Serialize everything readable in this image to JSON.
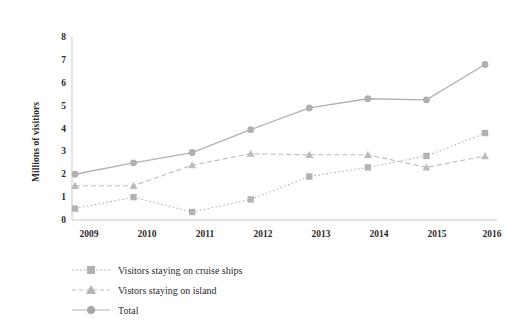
{
  "chart_data": {
    "type": "line",
    "title": "",
    "xlabel": "",
    "ylabel": "Millions of visitiors",
    "categories": [
      "2009",
      "2010",
      "2011",
      "2012",
      "2013",
      "2014",
      "2015",
      "2016"
    ],
    "ylim": [
      0,
      8
    ],
    "yticks": [
      "0",
      "1",
      "2",
      "3",
      "4",
      "5",
      "6",
      "7",
      "8"
    ],
    "grid": false,
    "legend_position": "bottom-left",
    "series": [
      {
        "name": "Visitors staying on cruise ships",
        "marker": "square",
        "line_style": "dotted",
        "color": "#b3b3b3",
        "values": [
          0.5,
          1.0,
          0.35,
          0.9,
          1.9,
          2.3,
          2.8,
          3.8
        ]
      },
      {
        "name": "Vistors staying on island",
        "marker": "triangle",
        "line_style": "dashed",
        "color": "#bcbcbc",
        "values": [
          1.5,
          1.5,
          2.4,
          2.9,
          2.85,
          2.85,
          2.3,
          2.8
        ]
      },
      {
        "name": "Total",
        "marker": "circle",
        "line_style": "solid",
        "color": "#b0b0b0",
        "values": [
          2.0,
          2.5,
          2.95,
          3.95,
          4.9,
          5.3,
          5.25,
          6.8
        ]
      }
    ]
  },
  "axis": {
    "y_title": "Millions of visitiors",
    "y_ticks": [
      "8",
      "7",
      "6",
      "5",
      "4",
      "3",
      "2",
      "1",
      "0"
    ],
    "x_ticks": [
      "2009",
      "2010",
      "2011",
      "2012",
      "2013",
      "2014",
      "2015",
      "2016"
    ]
  },
  "legend": {
    "items": [
      {
        "label": "Visitors staying on cruise ships",
        "marker": "square-marker-icon"
      },
      {
        "label": "Vistors staying on island",
        "marker": "triangle-marker-icon"
      },
      {
        "label": "Total",
        "marker": "circle-marker-icon"
      }
    ]
  },
  "colors": {
    "axis": "#c9c9c9",
    "text": "#2b2b2b",
    "cruise": "#b3b3b3",
    "island": "#bcbcbc",
    "total": "#b0b0b0"
  }
}
